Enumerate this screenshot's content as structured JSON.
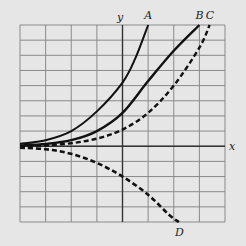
{
  "figure": {
    "background": "#e6e6e6",
    "grid_color": "#8a8a8a",
    "axis_color": "#333333",
    "curve_color": "#111111",
    "axis_labels": {
      "x": "x",
      "y": "y"
    }
  },
  "chart_data": {
    "type": "line",
    "title": "",
    "xlabel": "x",
    "ylabel": "y",
    "grid": true,
    "xlim": [
      -4,
      4
    ],
    "ylim": [
      -5,
      8
    ],
    "series": [
      {
        "name": "A",
        "style": "solid",
        "width": 2.0,
        "points": [
          [
            -4,
            0.15
          ],
          [
            -3,
            0.4
          ],
          [
            -2,
            1.0
          ],
          [
            -1,
            2.3
          ],
          [
            0,
            4.2
          ],
          [
            0.5,
            5.8
          ],
          [
            1,
            8
          ]
        ]
      },
      {
        "name": "B",
        "style": "solid",
        "width": 2.4,
        "points": [
          [
            -4,
            0.05
          ],
          [
            -3,
            0.15
          ],
          [
            -2,
            0.4
          ],
          [
            -1,
            1.0
          ],
          [
            0,
            2.2
          ],
          [
            1,
            4.3
          ],
          [
            2,
            6.3
          ],
          [
            3,
            8
          ]
        ]
      },
      {
        "name": "C",
        "style": "dashed",
        "width": 2.4,
        "points": [
          [
            -4,
            -0.05
          ],
          [
            -3,
            0.05
          ],
          [
            -2,
            0.2
          ],
          [
            -1,
            0.5
          ],
          [
            0,
            1.1
          ],
          [
            1,
            2.2
          ],
          [
            2,
            4.0
          ],
          [
            3,
            6.5
          ],
          [
            3.4,
            8
          ]
        ]
      },
      {
        "name": "D",
        "style": "dashed",
        "width": 2.6,
        "points": [
          [
            -4,
            -0.1
          ],
          [
            -3,
            -0.2
          ],
          [
            -2,
            -0.5
          ],
          [
            -1,
            -1.1
          ],
          [
            0,
            -2.0
          ],
          [
            1,
            -3.2
          ],
          [
            1.8,
            -4.5
          ],
          [
            2.2,
            -5
          ]
        ]
      }
    ]
  }
}
